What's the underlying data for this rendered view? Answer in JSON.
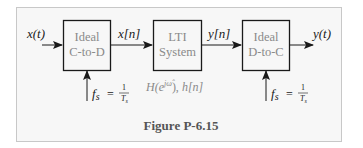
{
  "figure": {
    "caption": "Figure P-6.15",
    "panel_bg": "#f7f7f7",
    "panel_border": "#c8c8c8",
    "box_border": "#1a1a1a",
    "box_text_color": "#8a8a8a"
  },
  "blocks": [
    {
      "id": "c2d",
      "line1": "Ideal",
      "line2": "C-to-D"
    },
    {
      "id": "lti",
      "line1": "LTI",
      "line2": "System"
    },
    {
      "id": "d2c",
      "line1": "Ideal",
      "line2": "D-to-C"
    }
  ],
  "signals": {
    "input": "x(t)",
    "sampled": "x[n]",
    "filtered": "y[n]",
    "output": "y(t)"
  },
  "lti_label": {
    "freq_response_base": "H(e",
    "freq_response_exp": "jω̂",
    "freq_response_close": "), ",
    "impulse_response": "h[n]"
  },
  "sampling": {
    "c2d": {
      "lhs": "f",
      "sub": "s",
      "eq": "=",
      "num": "1",
      "den": "T",
      "den_sub": "s"
    },
    "d2c": {
      "lhs": "f",
      "sub": "s",
      "eq": "=",
      "num": "1",
      "den": "T",
      "den_sub": "s"
    }
  }
}
